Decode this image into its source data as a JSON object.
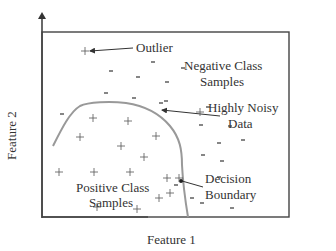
{
  "diagram": {
    "title": "",
    "axes": {
      "x_label": "Feature 1",
      "y_label": "Feature 2"
    },
    "annotations": {
      "outlier": "Outlier",
      "negative_line1": "Negative Class",
      "negative_line2": "Samples",
      "noisy_line1": "Highly Noisy",
      "noisy_line2": "Data",
      "positive_line1": "Positive Class",
      "positive_line2": "Samples",
      "boundary_line1": "Decision",
      "boundary_line2": "Boundary"
    },
    "colors": {
      "axis": "#444444",
      "boundary": "#999999",
      "text": "#333333",
      "marker": "#555555"
    },
    "positive_markers": [
      [
        85,
        51
      ],
      [
        93,
        118
      ],
      [
        128,
        121
      ],
      [
        80,
        137
      ],
      [
        121,
        146
      ],
      [
        156,
        136
      ],
      [
        144,
        157
      ],
      [
        59,
        172
      ],
      [
        94,
        172
      ],
      [
        130,
        172
      ],
      [
        167,
        178
      ],
      [
        159,
        198
      ],
      [
        97,
        207
      ],
      [
        137,
        209
      ],
      [
        200,
        112
      ],
      [
        179,
        178
      ],
      [
        170,
        193
      ]
    ],
    "negative_markers": [
      [
        111,
        71
      ],
      [
        153,
        62
      ],
      [
        138,
        77
      ],
      [
        167,
        82
      ],
      [
        106,
        93
      ],
      [
        134,
        98
      ],
      [
        183,
        68
      ],
      [
        166,
        101
      ],
      [
        62,
        114
      ],
      [
        161,
        103
      ],
      [
        201,
        125
      ],
      [
        230,
        126
      ],
      [
        219,
        143
      ],
      [
        243,
        140
      ],
      [
        203,
        155
      ],
      [
        219,
        177
      ],
      [
        222,
        161
      ],
      [
        192,
        198
      ],
      [
        232,
        208
      ],
      [
        202,
        203
      ],
      [
        176,
        185
      ],
      [
        208,
        107
      ]
    ]
  }
}
